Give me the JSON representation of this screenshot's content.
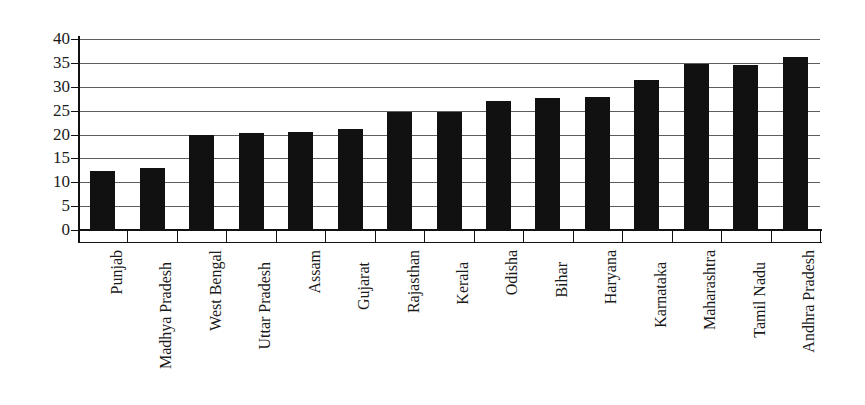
{
  "chart_data": {
    "type": "bar",
    "title": "",
    "subtitle": "",
    "xlabel": "",
    "ylabel": "",
    "ylim": [
      0,
      40
    ],
    "ytick_step": 5,
    "yticks": [
      0,
      5,
      10,
      15,
      20,
      25,
      30,
      35,
      40
    ],
    "grid": true,
    "legend": null,
    "orientation": "vertical",
    "bar_color": "#111111",
    "grid_color": "#5d5d5d",
    "background_color": "#ffffff",
    "categories": [
      "Punjab",
      "Madhya Pradesh",
      "West Bengal",
      "Uttar Pradesh",
      "Assam",
      "Gujarat",
      "Rajasthan",
      "Kerala",
      "Odisha",
      "Bihar",
      "Haryana",
      "Karnataka",
      "Maharashtra",
      "Tamil Nadu",
      "Andhra Pradesh"
    ],
    "values": [
      12.4,
      13.0,
      19.9,
      20.3,
      20.5,
      21.2,
      24.7,
      24.7,
      27.0,
      27.6,
      27.9,
      31.5,
      34.7,
      34.5,
      36.3
    ]
  }
}
